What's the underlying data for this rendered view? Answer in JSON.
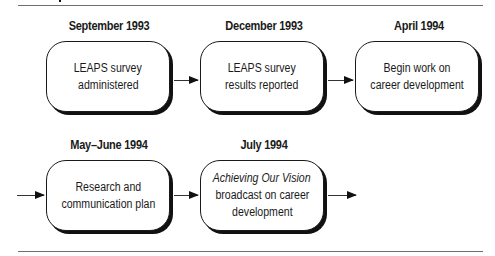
{
  "diagram": {
    "type": "timeline-flowchart",
    "rows": [
      {
        "steps": [
          {
            "date": "September 1993",
            "lines": [
              "LEAPS survey",
              "administered"
            ]
          },
          {
            "date": "December 1993",
            "lines": [
              "LEAPS survey",
              "results reported"
            ]
          },
          {
            "date": "April 1994",
            "lines": [
              "Begin work on",
              "career development"
            ]
          }
        ]
      },
      {
        "steps": [
          {
            "date": "May–June 1994",
            "lines": [
              "Research and",
              "communication plan"
            ]
          },
          {
            "date": "July 1994",
            "italic_line": "Achieving Our Vision",
            "lines": [
              "broadcast on career",
              "development"
            ]
          }
        ]
      }
    ],
    "colors": {
      "stroke": "#1a1a1a",
      "rule": "#6e6e6e",
      "background": "#ffffff"
    }
  }
}
